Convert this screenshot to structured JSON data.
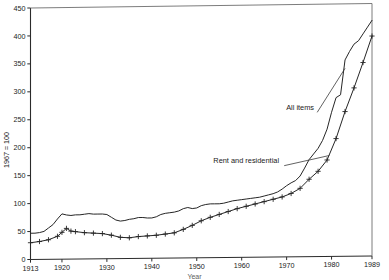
{
  "chart_data": {
    "type": "line",
    "title": "",
    "subtitle": "",
    "xlabel": "Year",
    "ylabel": "1967 = 100",
    "xlim": [
      1913,
      1989
    ],
    "ylim": [
      0,
      450
    ],
    "grid": false,
    "legend_position": "inline-annotation",
    "y_ticks": [
      0,
      50,
      100,
      150,
      200,
      250,
      300,
      350,
      400,
      450
    ],
    "y_tick_labels": [
      "0",
      "50",
      "100",
      "150",
      "200",
      "250",
      "300",
      "350",
      "400",
      "450"
    ],
    "x_ticks": [
      1913,
      1920,
      1930,
      1940,
      1950,
      1960,
      1970,
      1980,
      1989
    ],
    "x_tick_labels": [
      "1913",
      "1920",
      "1930",
      "1940",
      "1950",
      "1960",
      "1970",
      "1980",
      "1989"
    ],
    "annotations": [
      {
        "text": "All items",
        "x": 1973,
        "y": 262
      },
      {
        "text": "Rent and residential",
        "x": 1961,
        "y": 168
      }
    ],
    "series": [
      {
        "name": "All items",
        "marker": "none",
        "x": [
          1913,
          1914,
          1915,
          1916,
          1917,
          1918,
          1919,
          1920,
          1921,
          1922,
          1923,
          1924,
          1925,
          1926,
          1927,
          1928,
          1929,
          1930,
          1931,
          1932,
          1933,
          1934,
          1935,
          1936,
          1937,
          1938,
          1939,
          1940,
          1941,
          1942,
          1943,
          1944,
          1945,
          1946,
          1947,
          1948,
          1949,
          1950,
          1951,
          1952,
          1953,
          1954,
          1955,
          1956,
          1957,
          1958,
          1959,
          1960,
          1961,
          1962,
          1963,
          1964,
          1965,
          1966,
          1967,
          1968,
          1969,
          1970,
          1971,
          1972,
          1973,
          1974,
          1975,
          1976,
          1977,
          1978,
          1979,
          1980,
          1981,
          1982,
          1983,
          1984,
          1985,
          1986,
          1987,
          1988,
          1989
        ],
        "values": [
          47,
          47,
          48,
          50,
          56,
          62,
          72,
          81,
          79,
          78,
          79,
          79,
          80,
          81,
          80,
          80,
          80,
          79,
          74,
          69,
          67,
          68,
          70,
          71,
          73,
          73,
          72,
          72,
          74,
          78,
          80,
          81,
          82,
          84,
          88,
          90,
          88,
          89,
          93,
          95,
          96,
          96,
          96,
          97,
          99,
          101,
          102,
          103,
          104,
          105,
          106,
          107,
          109,
          111,
          113,
          116,
          121,
          127,
          132,
          136,
          144,
          158,
          173,
          183,
          193,
          207,
          227,
          257,
          283,
          288,
          350,
          365,
          378,
          384,
          396,
          408,
          420
        ],
        "color": "#262626"
      },
      {
        "name": "Rent and residential",
        "marker": "plus",
        "x": [
          1913,
          1915,
          1917,
          1919,
          1920,
          1921,
          1922,
          1923,
          1925,
          1927,
          1929,
          1931,
          1933,
          1935,
          1937,
          1939,
          1941,
          1943,
          1945,
          1947,
          1949,
          1951,
          1953,
          1955,
          1957,
          1959,
          1961,
          1963,
          1965,
          1967,
          1969,
          1971,
          1973,
          1975,
          1977,
          1979,
          1981,
          1983,
          1985,
          1987,
          1989
        ],
        "values": [
          30,
          32,
          35,
          41,
          48,
          55,
          50,
          49,
          47,
          46,
          45,
          42,
          38,
          37,
          39,
          40,
          41,
          43,
          45,
          51,
          58,
          66,
          72,
          77,
          82,
          87,
          91,
          95,
          99,
          103,
          107,
          113,
          122,
          138,
          152,
          172,
          210,
          258,
          300,
          345,
          392
        ],
        "color": "#262626"
      }
    ]
  },
  "axes": {
    "ylabel": "1967 = 100",
    "xlabel": "Year"
  }
}
